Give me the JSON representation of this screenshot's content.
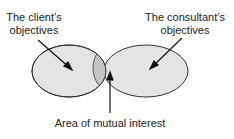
{
  "diagram": {
    "type": "venn",
    "sets": [
      {
        "label_line1": "The client’s",
        "label_line2": "objectives"
      },
      {
        "label_line1": "The consultant’s",
        "label_line2": "objectives"
      }
    ],
    "intersection_label": "Area of mutual interest",
    "colors": {
      "set_fill": "#e4e4e4",
      "intersection_fill": "#c4c4c4",
      "stroke": "#333333"
    }
  }
}
